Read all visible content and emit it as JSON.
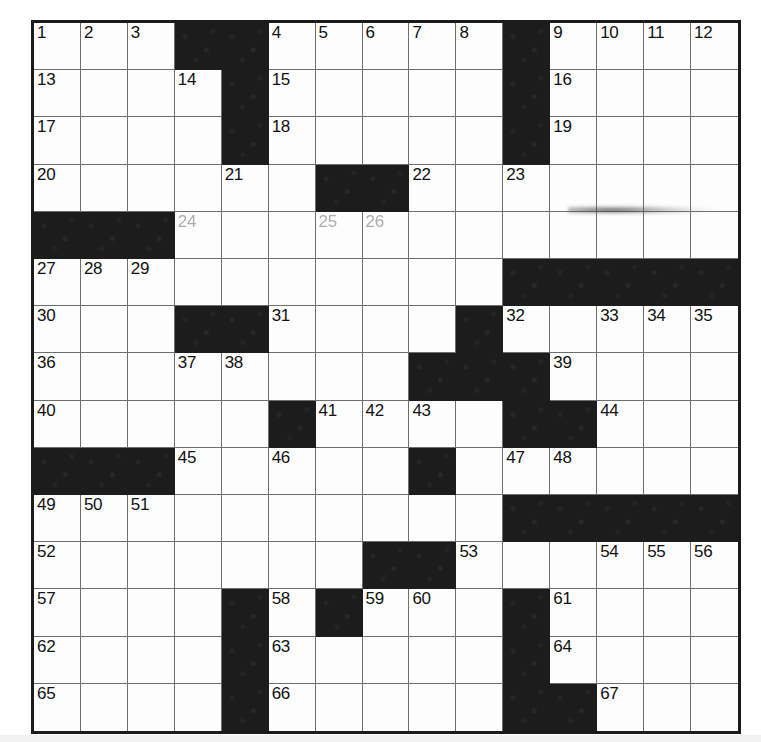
{
  "puzzle": {
    "title": "Crossword Grid",
    "rows": 15,
    "columns": 15,
    "colors": {
      "block": "#1c1c1c",
      "cell": "#fdfdfd",
      "border": "#1b1b1b",
      "gridline": "#6e6e6e",
      "number": "#111111"
    },
    "blocks": [
      [
        1,
        4
      ],
      [
        1,
        5
      ],
      [
        1,
        11
      ],
      [
        2,
        5
      ],
      [
        2,
        11
      ],
      [
        3,
        5
      ],
      [
        3,
        11
      ],
      [
        4,
        7
      ],
      [
        4,
        8
      ],
      [
        5,
        1
      ],
      [
        5,
        2
      ],
      [
        5,
        3
      ],
      [
        6,
        11
      ],
      [
        6,
        12
      ],
      [
        6,
        13
      ],
      [
        6,
        14
      ],
      [
        6,
        15
      ],
      [
        7,
        4
      ],
      [
        7,
        5
      ],
      [
        7,
        10
      ],
      [
        8,
        9
      ],
      [
        8,
        10
      ],
      [
        8,
        11
      ],
      [
        9,
        6
      ],
      [
        9,
        11
      ],
      [
        9,
        12
      ],
      [
        10,
        1
      ],
      [
        10,
        2
      ],
      [
        10,
        3
      ],
      [
        10,
        9
      ],
      [
        11,
        11
      ],
      [
        11,
        12
      ],
      [
        11,
        13
      ],
      [
        11,
        14
      ],
      [
        11,
        15
      ],
      [
        12,
        8
      ],
      [
        12,
        9
      ],
      [
        13,
        5
      ],
      [
        13,
        7
      ],
      [
        13,
        11
      ],
      [
        14,
        5
      ],
      [
        14,
        11
      ],
      [
        15,
        5
      ],
      [
        15,
        11
      ],
      [
        15,
        12
      ]
    ],
    "numbers": [
      {
        "n": "1",
        "row": 1,
        "col": 1,
        "faded": false
      },
      {
        "n": "2",
        "row": 1,
        "col": 2,
        "faded": false
      },
      {
        "n": "3",
        "row": 1,
        "col": 3,
        "faded": false
      },
      {
        "n": "4",
        "row": 1,
        "col": 6,
        "faded": false
      },
      {
        "n": "5",
        "row": 1,
        "col": 7,
        "faded": false
      },
      {
        "n": "6",
        "row": 1,
        "col": 8,
        "faded": false
      },
      {
        "n": "7",
        "row": 1,
        "col": 9,
        "faded": false
      },
      {
        "n": "8",
        "row": 1,
        "col": 10,
        "faded": false
      },
      {
        "n": "9",
        "row": 1,
        "col": 12,
        "faded": false
      },
      {
        "n": "10",
        "row": 1,
        "col": 13,
        "faded": false
      },
      {
        "n": "11",
        "row": 1,
        "col": 14,
        "faded": false
      },
      {
        "n": "12",
        "row": 1,
        "col": 15,
        "faded": false
      },
      {
        "n": "13",
        "row": 2,
        "col": 1,
        "faded": false
      },
      {
        "n": "14",
        "row": 2,
        "col": 4,
        "faded": false
      },
      {
        "n": "15",
        "row": 2,
        "col": 6,
        "faded": false
      },
      {
        "n": "16",
        "row": 2,
        "col": 12,
        "faded": false
      },
      {
        "n": "17",
        "row": 3,
        "col": 1,
        "faded": false
      },
      {
        "n": "18",
        "row": 3,
        "col": 6,
        "faded": false
      },
      {
        "n": "19",
        "row": 3,
        "col": 12,
        "faded": false
      },
      {
        "n": "20",
        "row": 4,
        "col": 1,
        "faded": false
      },
      {
        "n": "21",
        "row": 4,
        "col": 5,
        "faded": false
      },
      {
        "n": "22",
        "row": 4,
        "col": 9,
        "faded": false
      },
      {
        "n": "23",
        "row": 4,
        "col": 11,
        "faded": false
      },
      {
        "n": "24",
        "row": 5,
        "col": 4,
        "faded": true
      },
      {
        "n": "25",
        "row": 5,
        "col": 7,
        "faded": true
      },
      {
        "n": "26",
        "row": 5,
        "col": 8,
        "faded": true
      },
      {
        "n": "27",
        "row": 6,
        "col": 1,
        "faded": false
      },
      {
        "n": "28",
        "row": 6,
        "col": 2,
        "faded": false
      },
      {
        "n": "29",
        "row": 6,
        "col": 3,
        "faded": false
      },
      {
        "n": "30",
        "row": 7,
        "col": 1,
        "faded": false
      },
      {
        "n": "31",
        "row": 7,
        "col": 6,
        "faded": false
      },
      {
        "n": "32",
        "row": 7,
        "col": 11,
        "faded": false
      },
      {
        "n": "33",
        "row": 7,
        "col": 13,
        "faded": false
      },
      {
        "n": "34",
        "row": 7,
        "col": 14,
        "faded": false
      },
      {
        "n": "35",
        "row": 7,
        "col": 15,
        "faded": false
      },
      {
        "n": "36",
        "row": 8,
        "col": 1,
        "faded": false
      },
      {
        "n": "37",
        "row": 8,
        "col": 4,
        "faded": false
      },
      {
        "n": "38",
        "row": 8,
        "col": 5,
        "faded": false
      },
      {
        "n": "39",
        "row": 8,
        "col": 12,
        "faded": false
      },
      {
        "n": "40",
        "row": 9,
        "col": 1,
        "faded": false
      },
      {
        "n": "41",
        "row": 9,
        "col": 7,
        "faded": false
      },
      {
        "n": "42",
        "row": 9,
        "col": 8,
        "faded": false
      },
      {
        "n": "43",
        "row": 9,
        "col": 9,
        "faded": false
      },
      {
        "n": "44",
        "row": 9,
        "col": 13,
        "faded": false
      },
      {
        "n": "45",
        "row": 10,
        "col": 4,
        "faded": false
      },
      {
        "n": "46",
        "row": 10,
        "col": 6,
        "faded": false
      },
      {
        "n": "47",
        "row": 10,
        "col": 11,
        "faded": false
      },
      {
        "n": "48",
        "row": 10,
        "col": 12,
        "faded": false
      },
      {
        "n": "49",
        "row": 11,
        "col": 1,
        "faded": false
      },
      {
        "n": "50",
        "row": 11,
        "col": 2,
        "faded": false
      },
      {
        "n": "51",
        "row": 11,
        "col": 3,
        "faded": false
      },
      {
        "n": "52",
        "row": 12,
        "col": 1,
        "faded": false
      },
      {
        "n": "53",
        "row": 12,
        "col": 10,
        "faded": false
      },
      {
        "n": "54",
        "row": 12,
        "col": 13,
        "faded": false
      },
      {
        "n": "55",
        "row": 12,
        "col": 14,
        "faded": false
      },
      {
        "n": "56",
        "row": 12,
        "col": 15,
        "faded": false
      },
      {
        "n": "57",
        "row": 13,
        "col": 1,
        "faded": false
      },
      {
        "n": "58",
        "row": 13,
        "col": 6,
        "faded": false
      },
      {
        "n": "59",
        "row": 13,
        "col": 8,
        "faded": false
      },
      {
        "n": "60",
        "row": 13,
        "col": 9,
        "faded": false
      },
      {
        "n": "61",
        "row": 13,
        "col": 12,
        "faded": false
      },
      {
        "n": "62",
        "row": 14,
        "col": 1,
        "faded": false
      },
      {
        "n": "63",
        "row": 14,
        "col": 6,
        "faded": false
      },
      {
        "n": "64",
        "row": 14,
        "col": 12,
        "faded": false
      },
      {
        "n": "65",
        "row": 15,
        "col": 1,
        "faded": false
      },
      {
        "n": "66",
        "row": 15,
        "col": 6,
        "faded": false
      },
      {
        "n": "67",
        "row": 15,
        "col": 13,
        "faded": false
      }
    ]
  }
}
